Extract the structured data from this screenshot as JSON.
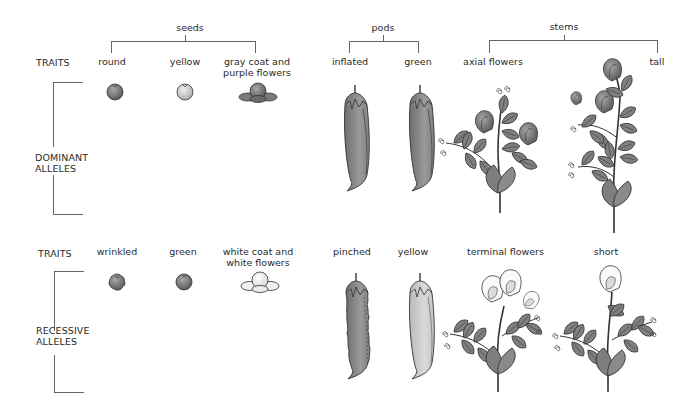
{
  "groups": {
    "seeds": "seeds",
    "pods": "pods",
    "stems": "stems"
  },
  "dominant": {
    "traits_label": "TRAITS",
    "section_label_line1": "DOMINANT",
    "section_label_line2": "ALLELES",
    "traits": [
      {
        "group": "seeds",
        "label": "round"
      },
      {
        "group": "seeds",
        "label": "yellow"
      },
      {
        "group": "seeds",
        "label_line1": "gray coat and",
        "label_line2": "purple flowers"
      },
      {
        "group": "pods",
        "label": "inflated"
      },
      {
        "group": "pods",
        "label": "green"
      },
      {
        "group": "stems",
        "label": "axial flowers"
      },
      {
        "group": "stems",
        "label": "tall"
      }
    ]
  },
  "recessive": {
    "traits_label": "TRAITS",
    "section_label_line1": "RECESSIVE",
    "section_label_line2": "ALLELES",
    "traits": [
      {
        "group": "seeds",
        "label": "wrinkled"
      },
      {
        "group": "seeds",
        "label": "green"
      },
      {
        "group": "seeds",
        "label_line1": "white coat and",
        "label_line2": "white flowers"
      },
      {
        "group": "pods",
        "label": "pinched"
      },
      {
        "group": "pods",
        "label": "yellow"
      },
      {
        "group": "stems",
        "label": "terminal flowers"
      },
      {
        "group": "stems",
        "label": "short"
      }
    ]
  },
  "colors": {
    "fill_dark": "#7a7a7a",
    "fill_mid": "#9a9a9a",
    "fill_light": "#cfcfcf",
    "fill_white": "#f4f4f4",
    "stroke": "#333333",
    "bracket": "#666666"
  }
}
